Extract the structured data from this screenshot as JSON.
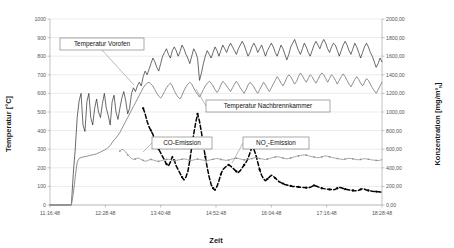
{
  "chart_data": {
    "type": "line",
    "title": "",
    "xlabel": "Zeit",
    "ylabel": "Temperatur [°C]",
    "y2label_main": "Konzentration  [mg/m³",
    "y2label_sub": "N",
    "y2label_tail": "]",
    "grid": true,
    "legend_position": "inline-callouts",
    "ylim": [
      0,
      1000
    ],
    "y2lim": [
      0,
      2000
    ],
    "yticks": [
      "0",
      "100",
      "200",
      "300",
      "400",
      "500",
      "600",
      "700",
      "800",
      "900",
      "1000"
    ],
    "y2ticks": [
      "0,00",
      "200,00",
      "400,00",
      "600,00",
      "800,00",
      "1000,00",
      "1200,00",
      "1400,00",
      "1600,00",
      "1800,00",
      "2000,00"
    ],
    "xticks": [
      "11:16:48",
      "12:28:48",
      "13:40:48",
      "14:52:48",
      "16:04:48",
      "17:16:48",
      "18:28:48"
    ],
    "xtick_positions": [
      0,
      0.1667,
      0.3333,
      0.5,
      0.6667,
      0.8333,
      1.0
    ],
    "series": [
      {
        "name": "Temperatur Vorofen",
        "axis": "left",
        "color": "#2b2b2b",
        "style": "solid-thin",
        "label_box": {
          "x": 60,
          "y": 38,
          "w": 84,
          "h": 12
        },
        "leader_to": {
          "x": 134,
          "y": 85
        },
        "values": [
          0,
          0,
          0,
          0,
          0,
          0,
          0,
          0,
          0,
          0,
          0,
          0,
          170,
          300,
          470,
          560,
          600,
          430,
          395,
          555,
          600,
          470,
          430,
          520,
          570,
          500,
          470,
          545,
          600,
          520,
          480,
          430,
          555,
          590,
          500,
          460,
          520,
          575,
          610,
          560,
          490,
          520,
          600,
          630,
          610,
          640,
          660,
          640,
          690,
          720,
          700,
          730,
          760,
          790,
          770,
          740,
          720,
          760,
          800,
          820,
          840,
          810,
          790,
          830,
          850,
          830,
          800,
          825,
          860,
          840,
          810,
          790,
          760,
          800,
          840,
          820,
          790,
          670,
          710,
          760,
          800,
          830,
          810,
          790,
          820,
          850,
          830,
          800,
          830,
          860,
          840,
          820,
          850,
          870,
          850,
          830,
          810,
          840,
          860,
          880,
          860,
          830,
          800,
          820,
          850,
          870,
          850,
          820,
          840,
          860,
          830,
          800,
          830,
          850,
          870,
          850,
          820,
          800,
          830,
          860,
          840,
          810,
          780,
          810,
          850,
          870,
          890,
          860,
          830,
          810,
          840,
          870,
          850,
          820,
          800,
          830,
          860,
          880,
          860,
          840,
          870,
          890,
          870,
          840,
          820,
          850,
          870,
          860,
          830,
          800,
          830,
          860,
          880,
          860,
          830,
          810,
          840,
          870,
          850,
          820,
          790,
          820,
          850,
          870,
          850,
          820,
          800,
          770,
          740,
          760,
          790,
          770
        ]
      },
      {
        "name": "Temperatur Nachbrennkammer",
        "axis": "left",
        "color": "#8a8a8a",
        "style": "solid-medium",
        "label_box": {
          "x": 206,
          "y": 100,
          "w": 124,
          "h": 12
        },
        "leader_to": {
          "x": 196,
          "y": 89
        },
        "values": [
          0,
          0,
          0,
          0,
          0,
          0,
          0,
          0,
          0,
          0,
          0,
          0,
          60,
          150,
          230,
          250,
          255,
          258,
          260,
          262,
          265,
          268,
          270,
          272,
          275,
          280,
          285,
          290,
          295,
          300,
          310,
          320,
          335,
          350,
          360,
          375,
          390,
          410,
          430,
          450,
          470,
          490,
          510,
          530,
          550,
          570,
          590,
          610,
          630,
          645,
          655,
          660,
          650,
          640,
          620,
          600,
          585,
          575,
          590,
          610,
          630,
          645,
          655,
          640,
          615,
          595,
          580,
          570,
          590,
          615,
          635,
          650,
          660,
          650,
          630,
          610,
          595,
          580,
          600,
          620,
          640,
          655,
          665,
          655,
          640,
          620,
          605,
          620,
          645,
          665,
          655,
          640,
          625,
          610,
          630,
          650,
          665,
          650,
          630,
          615,
          600,
          620,
          645,
          660,
          650,
          635,
          615,
          600,
          620,
          640,
          660,
          645,
          625,
          610,
          630,
          650,
          670,
          690,
          675,
          655,
          640,
          660,
          685,
          700,
          690,
          670,
          650,
          665,
          690,
          710,
          695,
          675,
          660,
          680,
          700,
          690,
          670,
          655,
          675,
          695,
          710,
          700,
          680,
          660,
          680,
          700,
          690,
          670,
          650,
          670,
          690,
          705,
          690,
          670,
          650,
          635,
          655,
          675,
          690,
          675,
          655,
          640,
          660,
          680,
          670,
          650,
          630,
          615,
          600,
          620,
          640,
          660
        ]
      },
      {
        "name": "CO-Emission",
        "axis": "right",
        "color": "#000000",
        "style": "dashed-marker",
        "label_box": {
          "x": 152,
          "y": 137,
          "w": 60,
          "h": 12
        },
        "leader_to": {
          "x": 143,
          "y": 152
        },
        "values": [
          null,
          null,
          null,
          null,
          null,
          null,
          null,
          null,
          null,
          null,
          null,
          null,
          null,
          null,
          null,
          null,
          null,
          null,
          null,
          null,
          null,
          null,
          null,
          null,
          null,
          null,
          null,
          null,
          null,
          null,
          null,
          null,
          null,
          null,
          null,
          null,
          null,
          null,
          null,
          null,
          null,
          null,
          null,
          null,
          null,
          null,
          null,
          null,
          1040,
          980,
          900,
          840,
          800,
          760,
          700,
          640,
          600,
          560,
          520,
          480,
          440,
          420,
          460,
          520,
          480,
          420,
          380,
          340,
          300,
          270,
          300,
          360,
          480,
          620,
          760,
          880,
          980,
          900,
          780,
          640,
          520,
          400,
          300,
          220,
          180,
          160,
          200,
          260,
          330,
          380,
          400,
          420,
          430,
          420,
          400,
          380,
          360,
          350,
          370,
          400,
          430,
          460,
          500,
          560,
          620,
          600,
          540,
          460,
          380,
          320,
          280,
          260,
          280,
          300,
          320,
          310,
          290,
          270,
          250,
          240,
          230,
          220,
          215,
          210,
          205,
          200,
          198,
          196,
          194,
          192,
          190,
          188,
          186,
          184,
          190,
          200,
          210,
          205,
          196,
          188,
          180,
          176,
          172,
          170,
          168,
          166,
          164,
          170,
          180,
          190,
          186,
          178,
          170,
          166,
          162,
          158,
          156,
          154,
          152,
          158,
          168,
          176,
          170,
          162,
          156,
          152,
          148,
          146,
          144,
          142,
          140,
          138
        ]
      },
      {
        "name": "NO_x-Emission",
        "axis": "right",
        "color": "#909090",
        "style": "solid-marker",
        "label_box": {
          "x": 243,
          "y": 137,
          "w": 66,
          "h": 12
        },
        "leader_to": {
          "x": 232,
          "y": 163
        },
        "values": [
          null,
          null,
          null,
          null,
          null,
          null,
          null,
          null,
          null,
          null,
          null,
          null,
          null,
          null,
          null,
          null,
          null,
          null,
          null,
          null,
          null,
          null,
          null,
          null,
          null,
          null,
          null,
          null,
          null,
          null,
          null,
          null,
          null,
          null,
          null,
          null,
          580,
          600,
          590,
          570,
          540,
          520,
          500,
          490,
          495,
          505,
          500,
          490,
          480,
          470,
          475,
          485,
          490,
          485,
          478,
          472,
          470,
          474,
          480,
          486,
          490,
          492,
          488,
          482,
          478,
          480,
          484,
          488,
          492,
          496,
          492,
          486,
          482,
          480,
          484,
          490,
          494,
          490,
          486,
          482,
          480,
          478,
          482,
          488,
          492,
          496,
          500,
          496,
          490,
          486,
          482,
          480,
          484,
          490,
          496,
          500,
          504,
          500,
          494,
          490,
          486,
          484,
          488,
          494,
          500,
          506,
          510,
          506,
          500,
          496,
          492,
          490,
          494,
          500,
          506,
          512,
          516,
          520,
          516,
          510,
          505,
          500,
          496,
          500,
          506,
          512,
          518,
          524,
          528,
          532,
          536,
          540,
          536,
          530,
          524,
          520,
          516,
          512,
          508,
          512,
          518,
          524,
          528,
          524,
          518,
          512,
          508,
          504,
          500,
          496,
          492,
          490,
          494,
          498,
          502,
          500,
          496,
          492,
          488,
          486,
          490,
          494,
          498,
          496,
          492,
          488,
          484,
          482,
          480,
          478,
          482,
          486
        ]
      }
    ]
  }
}
